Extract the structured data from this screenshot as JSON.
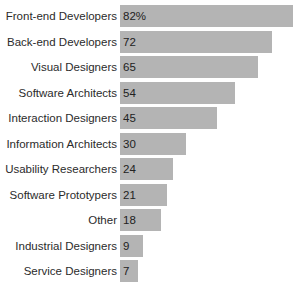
{
  "chart_data": {
    "type": "bar",
    "orientation": "horizontal",
    "title": "",
    "xlabel": "",
    "ylabel": "",
    "xlim": [
      0,
      82
    ],
    "grid": false,
    "legend": false,
    "bar_color": "#b4b4b4",
    "label_color": "#2b2b2b",
    "background": "#ffffff",
    "categories": [
      "Front-end Developers",
      "Back-end Developers",
      "Visual Designers",
      "Software Architects",
      "Interaction Designers",
      "Information Architects",
      "Usability Researchers",
      "Software Prototypers",
      "Other",
      "Industrial Designers",
      "Service Designers"
    ],
    "values": [
      82,
      72,
      65,
      54,
      45,
      30,
      24,
      21,
      18,
      9,
      7
    ],
    "value_labels": [
      "82%",
      "72",
      "65",
      "54",
      "45",
      "30",
      "24",
      "21",
      "18",
      "9",
      "7"
    ],
    "rows": [
      {
        "label": "Front-end Developers",
        "value": 82,
        "value_label": "82%"
      },
      {
        "label": "Back-end Developers",
        "value": 72,
        "value_label": "72"
      },
      {
        "label": "Visual Designers",
        "value": 65,
        "value_label": "65"
      },
      {
        "label": "Software Architects",
        "value": 54,
        "value_label": "54"
      },
      {
        "label": "Interaction Designers",
        "value": 45,
        "value_label": "45"
      },
      {
        "label": "Information Architects",
        "value": 30,
        "value_label": "30"
      },
      {
        "label": "Usability Researchers",
        "value": 24,
        "value_label": "24"
      },
      {
        "label": "Software Prototypers",
        "value": 21,
        "value_label": "21"
      },
      {
        "label": "Other",
        "value": 18,
        "value_label": "18"
      },
      {
        "label": "Industrial Designers",
        "value": 9,
        "value_label": "9"
      },
      {
        "label": "Service Designers",
        "value": 7,
        "value_label": "7"
      }
    ]
  }
}
